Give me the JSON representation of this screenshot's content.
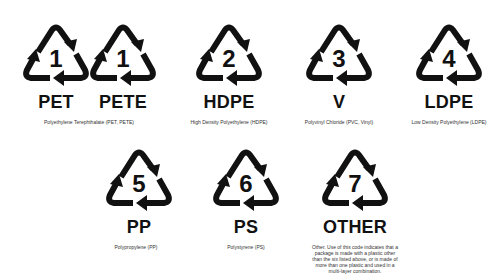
{
  "symbols": [
    {
      "number": "1",
      "code": "PET",
      "cx": 56,
      "top": 22
    },
    {
      "number": "1",
      "code": "PETE",
      "cx": 123,
      "top": 22
    },
    {
      "number": "2",
      "code": "HDPE",
      "cx": 229,
      "top": 22
    },
    {
      "number": "3",
      "code": "V",
      "cx": 339,
      "top": 22
    },
    {
      "number": "4",
      "code": "LDPE",
      "cx": 449,
      "top": 22
    },
    {
      "number": "5",
      "code": "PP",
      "cx": 139,
      "top": 147
    },
    {
      "number": "6",
      "code": "PS",
      "cx": 246,
      "top": 147
    },
    {
      "number": "7",
      "code": "OTHER",
      "cx": 355,
      "top": 147
    }
  ],
  "descriptions": {
    "pet": "Polyethylene Terephthalate (PET, PETE)",
    "hdpe": "High Density Polyethylene (HDPE)",
    "pvc": "Polyvinyl Chloride (PVC, Vinyl)",
    "ldpe": "Low Density Polyethylene (LDPE)",
    "pp": "Polypropylene (PP)",
    "ps": "Polystyrene (PS)",
    "other": "Other. Use of this code indicates that a package is made with a plastic other than the six listed above, or is made of more than one plastic and used in a multi-layer combination."
  },
  "colors": {
    "symbol": "#111111",
    "background": "#ffffff"
  }
}
